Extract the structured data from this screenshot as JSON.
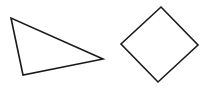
{
  "canvas": {
    "width": 209,
    "height": 89,
    "background": "#ffffff"
  },
  "stroke": {
    "color": "#1a1a1a",
    "width": 1.6
  },
  "shapes": [
    {
      "name": "triangle",
      "points": "11,18 23,75 103,59"
    },
    {
      "name": "square",
      "points": "161,7 198,45 158,82 121,44"
    }
  ]
}
